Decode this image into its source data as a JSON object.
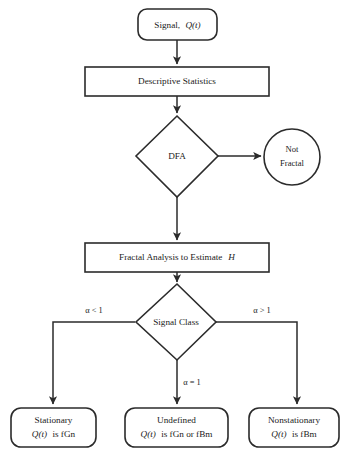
{
  "diagram": {
    "type": "flowchart",
    "nodes": {
      "signal": {
        "shape": "rounded-rectangle",
        "label": "Signal, Q(t)",
        "label_plain": "Signal,",
        "label_italic": "Q(t)"
      },
      "descriptive_statistics": {
        "shape": "rectangle",
        "label": "Descriptive Statistics"
      },
      "dfa": {
        "shape": "diamond",
        "label": "DFA"
      },
      "not_fractal": {
        "shape": "circle",
        "label_line1": "Not",
        "label_line2": "Fractal"
      },
      "fractal_analysis": {
        "shape": "rectangle",
        "label_plain": "Fractal Analysis to Estimate",
        "label_italic": "H"
      },
      "signal_class": {
        "shape": "diamond",
        "label": "Signal Class"
      },
      "stationary": {
        "shape": "rounded-rectangle",
        "line1": "Stationary",
        "line2_italic": "Q(t)",
        "line2_plain": "is fGn"
      },
      "undefined": {
        "shape": "rounded-rectangle",
        "line1": "Undefined",
        "line2_italic": "Q(t)",
        "line2_plain": "is fGn or fBm"
      },
      "nonstationary": {
        "shape": "rounded-rectangle",
        "line1": "Nonstationary",
        "line2_italic": "Q(t)",
        "line2_plain": "is fBm"
      }
    },
    "edge_labels": {
      "alpha_lt_1": "α < 1",
      "alpha_eq_1": "α = 1",
      "alpha_gt_1": "α > 1"
    },
    "colors": {
      "stroke": "#2b2b2b",
      "fill": "#ffffff",
      "text": "#1a1a1a",
      "background": "#ffffff"
    }
  }
}
